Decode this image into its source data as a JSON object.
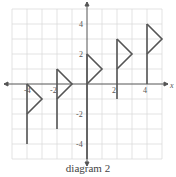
{
  "caption": "diagram 2",
  "axes": {
    "x_label": "x",
    "x_ticks": [
      "-4",
      "-2",
      "2",
      "4"
    ],
    "y_ticks": [
      "4",
      "2",
      "-2",
      "-4"
    ],
    "range": [
      -5,
      5
    ]
  },
  "colors": {
    "grid": "#dcdcdc",
    "axis": "#555555",
    "flag": "#555555"
  },
  "flags": [
    {
      "pole_x": -4,
      "pole_bottom": -4,
      "pole_top": 0,
      "tip": [
        -3,
        -1
      ],
      "flag_bottom": -2
    },
    {
      "pole_x": -2,
      "pole_bottom": -3,
      "pole_top": 1,
      "tip": [
        -1,
        0
      ],
      "flag_bottom": -1
    },
    {
      "pole_x": 0,
      "pole_bottom": -5,
      "pole_top": 2,
      "tip": [
        1,
        1
      ],
      "flag_bottom": 0
    },
    {
      "pole_x": 2,
      "pole_bottom": -1,
      "pole_top": 3,
      "tip": [
        3,
        2
      ],
      "flag_bottom": 1
    },
    {
      "pole_x": 4,
      "pole_bottom": 0,
      "pole_top": 4,
      "tip": [
        5,
        3
      ],
      "flag_bottom": 2
    }
  ]
}
